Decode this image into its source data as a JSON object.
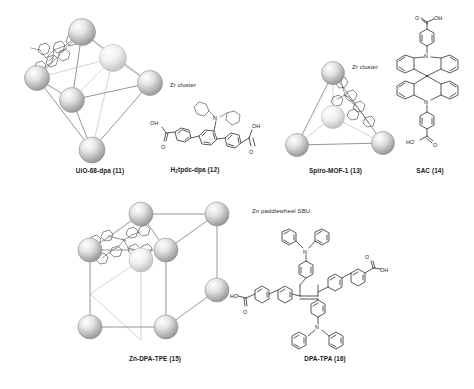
{
  "figure": {
    "background": "#ffffff",
    "panels": [
      {
        "id": "uio68",
        "caption": "UiO-68-dpa (11)",
        "caption_prefix": "UiO-68-dpa (11)",
        "annotation": "Zr cluster",
        "node_type": "Zr cluster",
        "geometry": "octahedron",
        "node_count": 6,
        "node_color": "#d8d8d8",
        "edge_color": "#8a8a8a"
      },
      {
        "id": "h2tpdc",
        "caption": "H2tpdc-dpa (12)",
        "caption_main": "tpdc-dpa (12)",
        "caption_lead": "H",
        "caption_sub": "2",
        "labels": [
          "OH",
          "O",
          "OH",
          "O",
          "N"
        ],
        "structure": "terphenyl dicarboxylic acid with diphenylamino group"
      },
      {
        "id": "spiro_mof",
        "caption": "Spiro-MOF-1 (13)",
        "annotation": "Zr cluster",
        "node_type": "Zr cluster",
        "geometry": "tetrahedron",
        "node_count": 4,
        "node_color": "#d8d8d8",
        "edge_color": "#8a8a8a"
      },
      {
        "id": "sac",
        "caption": "SAC (14)",
        "labels": [
          "O",
          "OH",
          "N",
          "N",
          "HO",
          "O"
        ],
        "structure": "spiro-bis(acridine) dicarboxylic acid"
      },
      {
        "id": "zn_dpa_tpe",
        "caption": "Zn-DPA-TPE (15)",
        "annotation": "Zn paddlewheel SBU",
        "node_type": "Zn paddlewheel SBU",
        "geometry": "cube",
        "node_count": 9,
        "node_color": "#e0e0e0",
        "edge_color": "#8a8a8a"
      },
      {
        "id": "dpa_tpa",
        "caption": "DPA-TPA (16)",
        "labels": [
          "N",
          "O",
          "OH",
          "HO",
          "O",
          "N"
        ],
        "structure": "tetraphenylethylene core with triphenylamine and biphenyl carboxylic acid arms"
      }
    ]
  }
}
